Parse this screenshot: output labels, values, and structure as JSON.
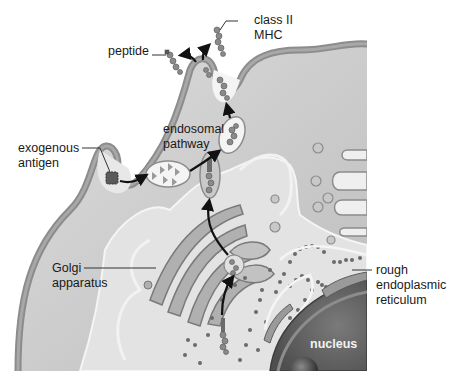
{
  "diagram": {
    "colors": {
      "background": "#ffffff",
      "cytoplasm": "#cfcfcf",
      "cytoplasm_light": "#e6e6e6",
      "membrane": "#8c8c8c",
      "organelle_fill": "#b3b3b3",
      "nucleus": "#6e6e6e",
      "arrow": "#111111",
      "label_text": "#1a1a1a"
    },
    "labels": {
      "peptide": "peptide",
      "class_ii_mhc": [
        "class II",
        "MHC"
      ],
      "exogenous_antigen": [
        "exogenous",
        "antigen"
      ],
      "endosomal_pathway": [
        "endosomal",
        "pathway"
      ],
      "golgi_apparatus": [
        "Golgi",
        "apparatus"
      ],
      "rough_er": [
        "rough",
        "endoplasmic",
        "reticulum"
      ],
      "nucleus": "nucleus"
    },
    "components": [
      "cell-membrane",
      "exogenous-antigen",
      "endocytic-vesicle",
      "endosome",
      "mhc-vesicle",
      "golgi-apparatus",
      "rough-endoplasmic-reticulum",
      "nucleus",
      "class-ii-mhc-molecules",
      "pathway-arrows"
    ]
  }
}
